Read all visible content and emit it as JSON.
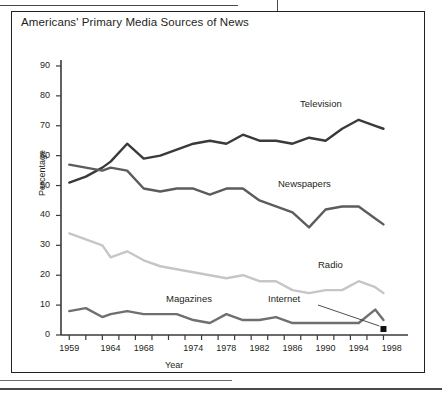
{
  "figure": {
    "title": "Americans' Primary Media Sources of News"
  },
  "chart_data": {
    "type": "line",
    "title": "Americans' Primary Media Sources of News",
    "xlabel": "Year",
    "ylabel": "Percentage",
    "xlim": [
      1958,
      1999
    ],
    "ylim": [
      0,
      92
    ],
    "yticks": [
      0,
      10,
      20,
      30,
      40,
      50,
      60,
      70,
      80,
      90
    ],
    "xticks": [
      1959,
      1964,
      1968,
      1974,
      1978,
      1982,
      1986,
      1990,
      1994,
      1998
    ],
    "xtick_labels": [
      "1959",
      "1964",
      "1968",
      "1974",
      "1978",
      "1982",
      "1986",
      "1990",
      "1994",
      "1998"
    ],
    "ytick_labels": [
      "0",
      "10",
      "20",
      "30",
      "40",
      "50",
      "60",
      "70",
      "80",
      "90"
    ],
    "grid": false,
    "legend": "inline-labels",
    "x": [
      1959,
      1961,
      1963,
      1964,
      1966,
      1968,
      1970,
      1972,
      1974,
      1976,
      1978,
      1980,
      1982,
      1984,
      1986,
      1988,
      1990,
      1992,
      1994,
      1996,
      1997
    ],
    "series": [
      {
        "name": "Television",
        "color": "#3a3a3a",
        "values": [
          51,
          53,
          56,
          58,
          64,
          59,
          60,
          62,
          64,
          65,
          64,
          67,
          65,
          65,
          64,
          66,
          65,
          69,
          72,
          70,
          69
        ]
      },
      {
        "name": "Newspapers",
        "color": "#5c5c5c",
        "values": [
          57,
          56,
          55,
          56,
          55,
          49,
          48,
          49,
          49,
          47,
          49,
          49,
          45,
          43,
          41,
          36,
          42,
          43,
          43,
          39,
          37
        ]
      },
      {
        "name": "Radio",
        "color": "#c6c6c6",
        "values": [
          34,
          32,
          30,
          26,
          28,
          25,
          23,
          22,
          21,
          20,
          19,
          20,
          18,
          18,
          15,
          14,
          15,
          15,
          18,
          16,
          14
        ]
      },
      {
        "name": "Magazines",
        "color": "#6f6f6f",
        "values": [
          8,
          9,
          6,
          7,
          8,
          7,
          7,
          7,
          5,
          4,
          7,
          5,
          5,
          6,
          4,
          4,
          4,
          4,
          4,
          8.5,
          5
        ]
      }
    ],
    "annotations": [
      {
        "name": "Internet",
        "label": "Internet",
        "point_year": 1997,
        "point_value": 2,
        "marker": "square",
        "marker_color": "#111111"
      }
    ],
    "series_labels": [
      {
        "name": "Television",
        "label": "Television"
      },
      {
        "name": "Newspapers",
        "label": "Newspapers"
      },
      {
        "name": "Radio",
        "label": "Radio"
      },
      {
        "name": "Magazines",
        "label": "Magazines"
      }
    ]
  },
  "axes": {
    "y_title": "Percentage",
    "x_title": "Year"
  }
}
